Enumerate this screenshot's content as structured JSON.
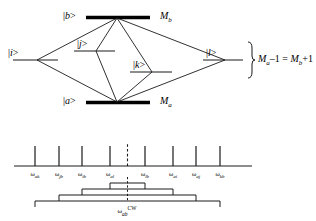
{
  "diagram": {
    "levels": {
      "b": {
        "ket": "|b>",
        "mlabel": "M",
        "msub": "b"
      },
      "a": {
        "ket": "|a>",
        "mlabel": "M",
        "msub": "a"
      },
      "i": {
        "ket": "|i>"
      },
      "j": {
        "ket": "|j>"
      },
      "k": {
        "ket": "|k>"
      },
      "l": {
        "ket": "|l>"
      }
    },
    "brace_equation": {
      "m1": "M",
      "m1sub": "a",
      "minus": "–1",
      "eq": "=",
      "m2": "M",
      "m2sub": "b",
      "plus": "+1",
      "full": "Ma–1 = Mb+1"
    }
  },
  "spectrum": {
    "lines": [
      {
        "label": "ω",
        "sub": "ak"
      },
      {
        "label": "ω",
        "sub": "jb"
      },
      {
        "label": "ω",
        "sub": "ib"
      },
      {
        "label": "ω",
        "sub": "al"
      },
      {
        "label": "ω",
        "sub": "lb"
      },
      {
        "label": "ω",
        "sub": "ai"
      },
      {
        "label": "ω",
        "sub": "aj"
      },
      {
        "label": "ω",
        "sub": "kb"
      }
    ],
    "center_label": {
      "omega": "ω",
      "sub": "ab",
      "sup": "CW"
    }
  },
  "colors": {
    "stroke": "#1a1a1a",
    "thick_level": "#000000",
    "background": "#ffffff"
  }
}
